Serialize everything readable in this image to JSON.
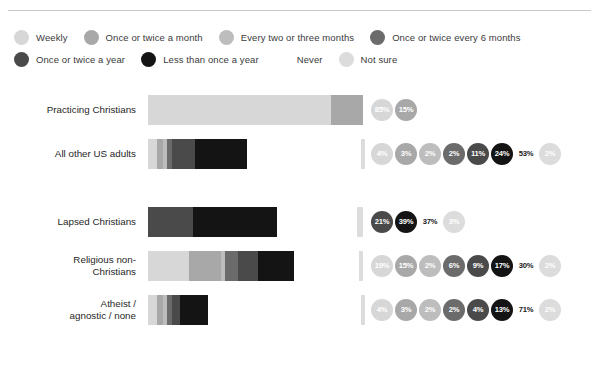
{
  "colors": {
    "weekly": "#d7d7d7",
    "once_twice_month": "#a8a8a8",
    "every_two_three_months": "#bdbdbd",
    "once_twice_6_months": "#6b6b6b",
    "once_twice_year": "#4a4a4a",
    "less_than_once_year": "#141414",
    "never": "#ffffff",
    "not_sure": "#dcdcdc",
    "rule": "#c9c9c9",
    "label_text": "#1f1f1f",
    "legend_text": "#3a3a3a",
    "bubble_text": "#ffffff",
    "never_bubble_text": "#1a1a1a"
  },
  "legend": {
    "rows": [
      [
        {
          "label": "Weekly",
          "key": "weekly"
        },
        {
          "label": "Once or twice a month",
          "key": "once_twice_month"
        },
        {
          "label": "Every two or three months",
          "key": "every_two_three_months"
        },
        {
          "label": "Once or twice every 6 months",
          "key": "once_twice_6_months"
        }
      ],
      [
        {
          "label": "Once or twice a year",
          "key": "once_twice_year"
        },
        {
          "label": "Less than once a year",
          "key": "less_than_once_year"
        },
        {
          "label": "Never",
          "key": "never"
        },
        {
          "label": "Not sure",
          "key": "not_sure"
        }
      ]
    ]
  },
  "chart_data": {
    "type": "bar",
    "title": "",
    "xlabel": "",
    "ylabel": "",
    "stacked": true,
    "orientation": "horizontal",
    "units": "percent",
    "xlim": [
      0,
      100
    ],
    "grid": false,
    "legend_position": "top",
    "categories": [
      "Practicing Christians",
      "All other US adults",
      "Lapsed Christians",
      "Religious non-Christians",
      "Atheist / agnostic / none"
    ],
    "series": [
      {
        "name": "Weekly",
        "key": "weekly",
        "values": [
          85,
          4,
          0,
          19,
          4
        ]
      },
      {
        "name": "Once or twice a month",
        "key": "once_twice_month",
        "values": [
          15,
          3,
          0,
          15,
          3
        ]
      },
      {
        "name": "Every two or three months",
        "key": "every_two_three_months",
        "values": [
          0,
          2,
          0,
          2,
          2
        ]
      },
      {
        "name": "Once or twice every 6 months",
        "key": "once_twice_6_months",
        "values": [
          0,
          2,
          0,
          6,
          2
        ]
      },
      {
        "name": "Once or twice a year",
        "key": "once_twice_year",
        "values": [
          0,
          11,
          21,
          9,
          4
        ]
      },
      {
        "name": "Less than once a year",
        "key": "less_than_once_year",
        "values": [
          0,
          24,
          39,
          17,
          13
        ]
      },
      {
        "name": "Never",
        "key": "never",
        "values": [
          0,
          53,
          37,
          30,
          71
        ]
      },
      {
        "name": "Not sure",
        "key": "not_sure",
        "values": [
          0,
          2,
          3,
          2,
          2
        ]
      }
    ]
  },
  "rows": [
    {
      "label": "Practicing Christians",
      "gap_before": false,
      "segments": [
        {
          "key": "weekly",
          "value": 85,
          "text": "85%"
        },
        {
          "key": "once_twice_month",
          "value": 15,
          "text": "15%"
        }
      ]
    },
    {
      "label": "All other US adults",
      "gap_before": false,
      "segments": [
        {
          "key": "weekly",
          "value": 4,
          "text": "4%"
        },
        {
          "key": "once_twice_month",
          "value": 3,
          "text": "3%"
        },
        {
          "key": "every_two_three_months",
          "value": 2,
          "text": "2%"
        },
        {
          "key": "once_twice_6_months",
          "value": 2,
          "text": "2%"
        },
        {
          "key": "once_twice_year",
          "value": 11,
          "text": "11%"
        },
        {
          "key": "less_than_once_year",
          "value": 24,
          "text": "24%"
        },
        {
          "key": "never",
          "value": 53,
          "text": "53%"
        },
        {
          "key": "not_sure",
          "value": 2,
          "text": "2%"
        }
      ]
    },
    {
      "label": "Lapsed Christians",
      "gap_before": true,
      "segments": [
        {
          "key": "once_twice_year",
          "value": 21,
          "text": "21%"
        },
        {
          "key": "less_than_once_year",
          "value": 39,
          "text": "39%"
        },
        {
          "key": "never",
          "value": 37,
          "text": "37%"
        },
        {
          "key": "not_sure",
          "value": 3,
          "text": "3%"
        }
      ]
    },
    {
      "label": "Religious non-\nChristians",
      "gap_before": false,
      "segments": [
        {
          "key": "weekly",
          "value": 19,
          "text": "19%"
        },
        {
          "key": "once_twice_month",
          "value": 15,
          "text": "15%"
        },
        {
          "key": "every_two_three_months",
          "value": 2,
          "text": "2%"
        },
        {
          "key": "once_twice_6_months",
          "value": 6,
          "text": "6%"
        },
        {
          "key": "once_twice_year",
          "value": 9,
          "text": "9%"
        },
        {
          "key": "less_than_once_year",
          "value": 17,
          "text": "17%"
        },
        {
          "key": "never",
          "value": 30,
          "text": "30%"
        },
        {
          "key": "not_sure",
          "value": 2,
          "text": "2%"
        }
      ]
    },
    {
      "label": "Atheist /\nagnostic / none",
      "gap_before": false,
      "segments": [
        {
          "key": "weekly",
          "value": 4,
          "text": "4%"
        },
        {
          "key": "once_twice_month",
          "value": 3,
          "text": "3%"
        },
        {
          "key": "every_two_three_months",
          "value": 2,
          "text": "2%"
        },
        {
          "key": "once_twice_6_months",
          "value": 2,
          "text": "2%"
        },
        {
          "key": "once_twice_year",
          "value": 4,
          "text": "4%"
        },
        {
          "key": "less_than_once_year",
          "value": 13,
          "text": "13%"
        },
        {
          "key": "never",
          "value": 71,
          "text": "71%"
        },
        {
          "key": "not_sure",
          "value": 2,
          "text": "2%"
        }
      ]
    }
  ]
}
